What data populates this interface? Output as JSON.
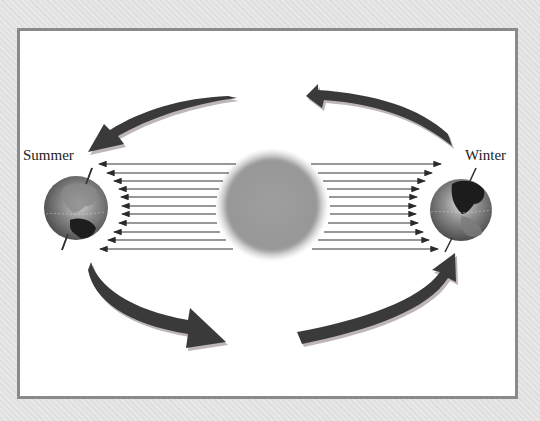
{
  "diagram": {
    "type": "earth-orbit-seasons",
    "labels": {
      "left": "Summer",
      "right": "Winter"
    },
    "elements": {
      "sun": {
        "name": "sun",
        "color": "#9a9a9a"
      },
      "left_globe": {
        "name": "earth-summer-position",
        "season": "Summer"
      },
      "right_globe": {
        "name": "earth-winter-position",
        "season": "Winter"
      },
      "rays_per_side": 11,
      "orbit_arrows": 4,
      "orbit_direction": "counter-clockwise"
    },
    "colors": {
      "background": "#e3e3e3",
      "frame_border": "#8a8a8a",
      "panel": "#ffffff",
      "arrow_fill": "#3a3a3a",
      "arrow_shadow": "#b0a8a8",
      "ray": "#333333",
      "text": "#222222"
    }
  }
}
